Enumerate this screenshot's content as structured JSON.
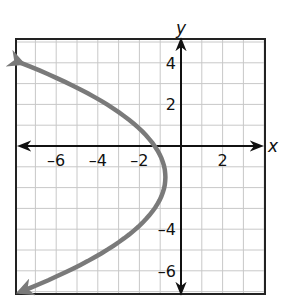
{
  "chart_data": {
    "type": "line",
    "title": "",
    "xlabel": "x",
    "ylabel": "y",
    "xlim": [
      -8,
      4
    ],
    "ylim": [
      -7,
      5
    ],
    "grid": true,
    "x_ticks": [
      -6,
      -4,
      -2,
      2
    ],
    "y_ticks": [
      4,
      2,
      -4,
      -6
    ],
    "x_tick_labels": [
      "–6",
      "–4",
      "–2",
      "2"
    ],
    "y_tick_labels": [
      "4",
      "2",
      "–4",
      "–6"
    ],
    "series": [
      {
        "name": "parabola opening left",
        "equation": "x = -0.23(y + 1.5)^2 - 0.75",
        "vertex": [
          -0.75,
          -1.5
        ],
        "endpoints": [
          [
            -7.7,
            4
          ],
          [
            -7.7,
            -7
          ]
        ],
        "arrows_at_ends": true,
        "color": "#7a7a7a"
      }
    ]
  },
  "colors": {
    "curve": "#7a7a7a",
    "grid": "#c8c8c8",
    "axis": "#111111",
    "frame": "#222222"
  }
}
